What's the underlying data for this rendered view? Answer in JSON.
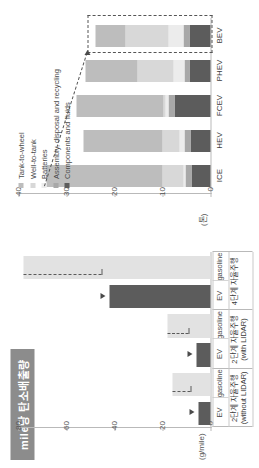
{
  "title": "mile당 탄소배출량",
  "top_chart": {
    "unit_label": "(g/mile)",
    "axis_ticks": [
      "80",
      "60",
      "40",
      "20",
      "0"
    ],
    "series_labels": {
      "gasoline": "gasoline",
      "ev": "EV"
    },
    "groups": [
      {
        "label_line1": "2단계 자율주행",
        "label_line2": "(without LIDAR)",
        "gasoline": 16,
        "ev": 5
      },
      {
        "label_line1": "2단계 자율주행",
        "label_line2": "(with LIDAR)",
        "gasoline": 18,
        "ev": 6
      },
      {
        "label_line1": "4단계 자율주행",
        "label_line2": "",
        "gasoline": 78,
        "ev": 42
      }
    ]
  },
  "bottom_chart": {
    "unit_label": "(톤)",
    "axis_ticks": [
      "40",
      "30",
      "20",
      "10",
      "0"
    ],
    "categories": [
      "ICE",
      "HEV",
      "FCEV",
      "PHEV",
      "BEV"
    ],
    "legend": [
      {
        "label": "Tank-to-wheel",
        "color": "#bdbdbd"
      },
      {
        "label": "Well-to-tank",
        "color": "#d8d8d8"
      },
      {
        "label": "Batteries",
        "color": "#ececec"
      },
      {
        "label": "Assembly, disposal and recycling",
        "color": "#a8a8a8"
      },
      {
        "label": "Components and fluids",
        "color": "#5c5c5c"
      }
    ],
    "stacks": [
      {
        "category": "ICE",
        "components_and_fluids": 4.0,
        "assembly": 1.3,
        "batteries": 0.3,
        "well_to_tank": 4.5,
        "tank_to_wheel": 24.0
      },
      {
        "category": "HEV",
        "components_and_fluids": 4.2,
        "assembly": 1.2,
        "batteries": 1.0,
        "well_to_tank": 3.6,
        "tank_to_wheel": 16.5
      },
      {
        "category": "FCEV",
        "components_and_fluids": 7.5,
        "assembly": 1.3,
        "batteries": 0.5,
        "well_to_tank": 0.4,
        "tank_to_wheel": 18.3
      },
      {
        "category": "PHEV",
        "components_and_fluids": 4.3,
        "assembly": 1.2,
        "batteries": 2.3,
        "well_to_tank": 7.5,
        "tank_to_wheel": 10.7
      },
      {
        "category": "BEV",
        "components_and_fluids": 4.4,
        "assembly": 1.3,
        "batteries": 3.0,
        "well_to_tank": 9.0,
        "tank_to_wheel": 6.3
      }
    ],
    "highlight_category": "BEV"
  }
}
